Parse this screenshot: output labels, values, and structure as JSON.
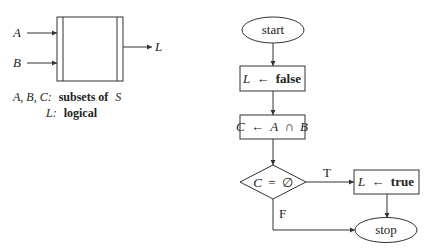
{
  "block_diagram": {
    "inputs": [
      {
        "label": "A"
      },
      {
        "label": "B"
      }
    ],
    "output": {
      "label": "L"
    },
    "legend": [
      {
        "vars": "A, B, C:",
        "desc": "subsets of",
        "set": "S"
      },
      {
        "vars": "L:",
        "desc": "logical"
      }
    ]
  },
  "flowchart": {
    "start": {
      "label": "start"
    },
    "assign_false": {
      "var": "L",
      "arrow": "←",
      "value": "false"
    },
    "assign_intersection": {
      "var": "C",
      "arrow": "←",
      "expr_left": "A",
      "op": "∩",
      "expr_right": "B"
    },
    "decision": {
      "var": "C",
      "op": "=",
      "value": "∅"
    },
    "branch_true_label": "T",
    "branch_false_label": "F",
    "assign_true": {
      "var": "L",
      "arrow": "←",
      "value": "true"
    },
    "stop": {
      "label": "stop"
    }
  }
}
